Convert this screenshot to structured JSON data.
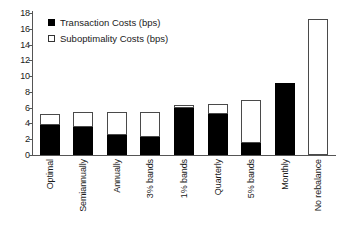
{
  "chart_data": {
    "type": "bar",
    "title": "",
    "subtitle": "",
    "xlabel": "",
    "ylabel": "",
    "stacked": true,
    "grid": false,
    "legend_position": "top-left",
    "ylim": [
      0,
      18
    ],
    "yticks": [
      0,
      2,
      4,
      6,
      8,
      10,
      12,
      14,
      16,
      18
    ],
    "ytick_labels": [
      "0",
      "2",
      "4",
      "6",
      "8",
      "10",
      "12",
      "14",
      "16",
      "18"
    ],
    "categories": [
      "Optimal",
      "Semiannually",
      "Annually",
      "3% bands",
      "1% bands",
      "Quarterly",
      "5% bands",
      "Monthly",
      "No rebalance"
    ],
    "series": [
      {
        "name": "Transaction Costs (bps)",
        "color": "#000000",
        "values": [
          3.8,
          3.6,
          2.5,
          2.3,
          5.9,
          5.2,
          1.5,
          9.1,
          0.0
        ]
      },
      {
        "name": "Suboptimality Costs (bps)",
        "color": "#ffffff",
        "values": [
          1.4,
          1.8,
          3.0,
          3.2,
          0.4,
          1.3,
          5.5,
          0.0,
          17.2
        ]
      }
    ],
    "totals": [
      5.2,
      5.4,
      5.5,
      5.5,
      6.3,
      6.5,
      7.0,
      9.1,
      17.2
    ]
  },
  "legend": {
    "items": [
      {
        "label": "Transaction Costs (bps)",
        "swatch": "filled-square-icon"
      },
      {
        "label": "Suboptimality Costs (bps)",
        "swatch": "open-square-icon"
      }
    ]
  }
}
